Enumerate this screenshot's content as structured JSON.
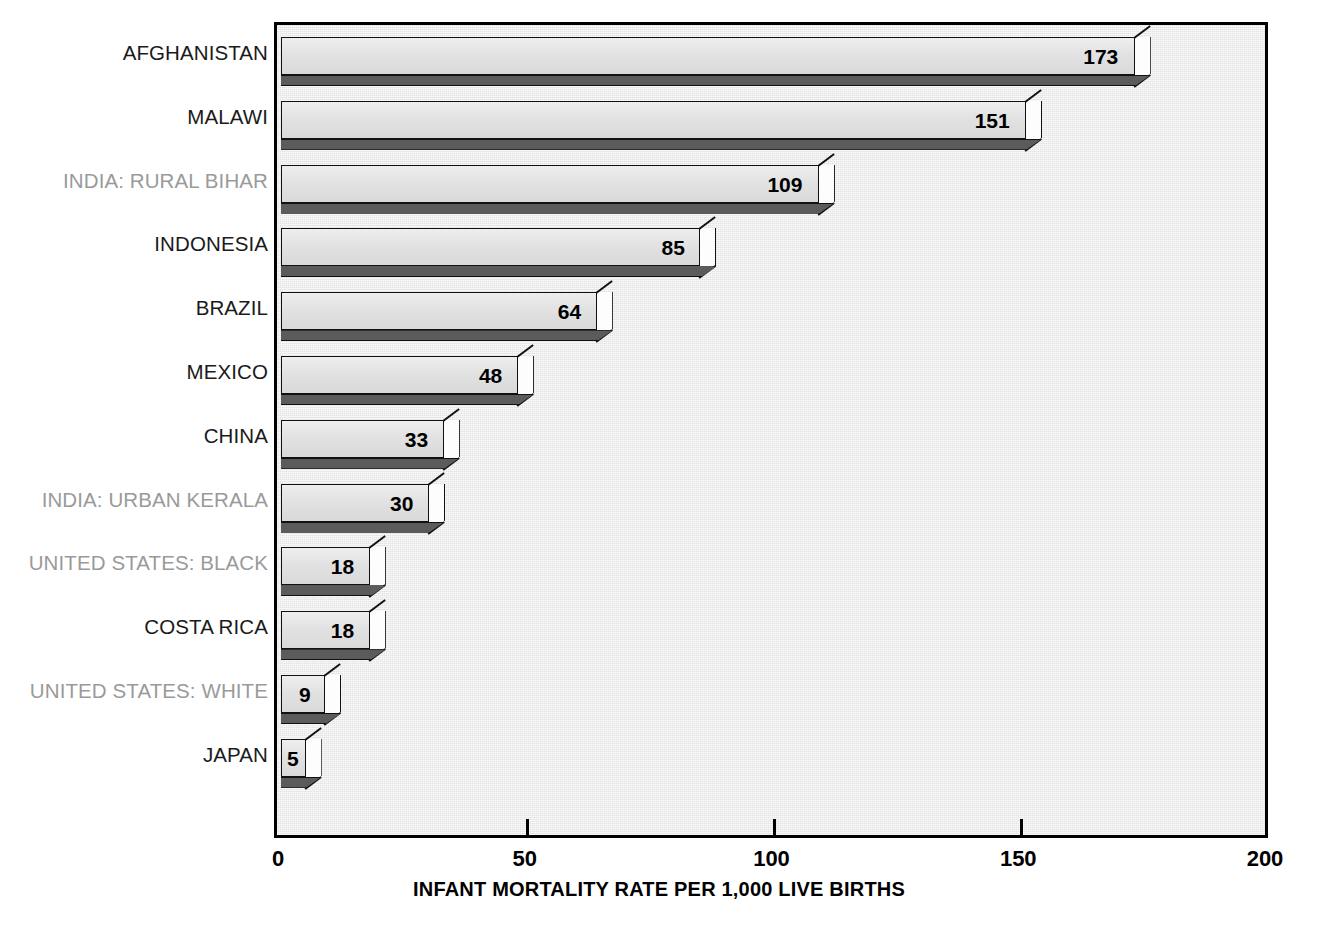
{
  "chart_data": {
    "type": "bar",
    "orientation": "horizontal",
    "title": "",
    "xlabel": "INFANT MORTALITY RATE PER 1,000 LIVE BIRTHS",
    "ylabel": "",
    "xlim": [
      0,
      200
    ],
    "xticks": [
      "0",
      "50",
      "100",
      "150",
      "200"
    ],
    "xtick_values": [
      0,
      50,
      100,
      150,
      200
    ],
    "grid": false,
    "legend": "none",
    "categories": [
      "AFGHANISTAN",
      "MALAWI",
      "INDIA: RURAL BIHAR",
      "INDONESIA",
      "BRAZIL",
      "MEXICO",
      "CHINA",
      "INDIA: URBAN KERALA",
      "UNITED STATES: BLACK",
      "COSTA RICA",
      "UNITED STATES: WHITE",
      "JAPAN"
    ],
    "values": [
      173,
      151,
      109,
      85,
      64,
      48,
      33,
      30,
      18,
      18,
      9,
      5
    ],
    "value_labels": [
      "173",
      "151",
      "109",
      "85",
      "64",
      "48",
      "33",
      "30",
      "18",
      "18",
      "9",
      "5"
    ],
    "label_styles": [
      "dark",
      "dark",
      "muted",
      "dark",
      "dark",
      "dark",
      "dark",
      "muted",
      "muted",
      "dark",
      "muted",
      "dark"
    ]
  },
  "colors": {
    "plot_background": "#e9e9e9",
    "bar_face": "#e2e2e2",
    "bar_shadow": "#5b5b5b",
    "bar_cap": "#fdfdfd",
    "outline": "#111111",
    "label_dark": "#1a1a1a",
    "label_muted": "#9a9a9a"
  }
}
